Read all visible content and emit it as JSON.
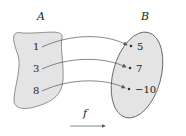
{
  "diagram": {
    "type": "function-mapping",
    "domain_set": {
      "label": "A",
      "elements": [
        "1",
        "3",
        "8"
      ]
    },
    "codomain_set": {
      "label": "B",
      "elements": [
        "5",
        "7",
        "−10"
      ]
    },
    "mappings": [
      {
        "from": "1",
        "to": "5"
      },
      {
        "from": "3",
        "to": "7"
      },
      {
        "from": "8",
        "to": "−10"
      }
    ],
    "function_label": "f",
    "colors": {
      "set_fill": "#e4e4e4",
      "stroke": "#555555"
    }
  }
}
